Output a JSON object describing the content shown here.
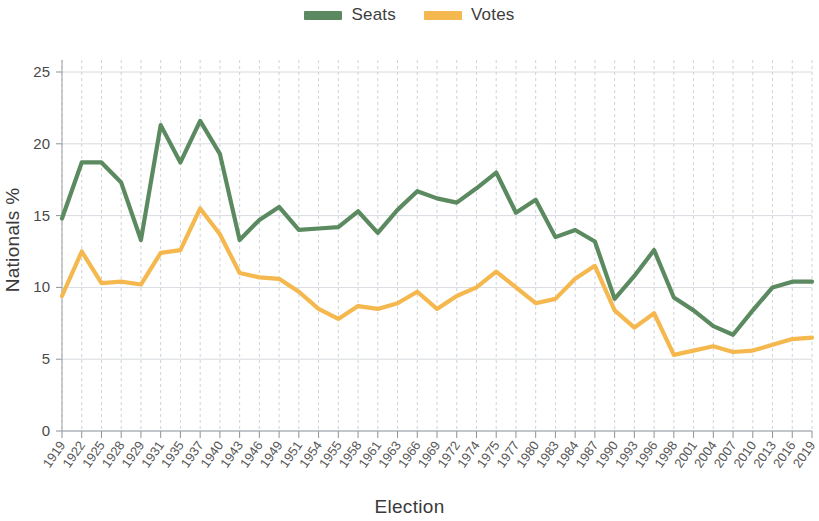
{
  "chart_data": {
    "type": "line",
    "title": "",
    "xlabel": "Election",
    "ylabel": "Nationals %",
    "ylim": [
      0,
      25
    ],
    "yticks": [
      0,
      5,
      10,
      15,
      20,
      25
    ],
    "grid": true,
    "legend_position": "top-center",
    "categories": [
      "1919",
      "1922",
      "1925",
      "1928",
      "1929",
      "1931",
      "1935",
      "1937",
      "1940",
      "1943",
      "1946",
      "1949",
      "1951",
      "1954",
      "1955",
      "1958",
      "1961",
      "1963",
      "1966",
      "1969",
      "1972",
      "1974",
      "1975",
      "1977",
      "1980",
      "1983",
      "1984",
      "1987",
      "1990",
      "1993",
      "1996",
      "1998",
      "2001",
      "2004",
      "2007",
      "2010",
      "2013",
      "2016",
      "2019"
    ],
    "series": [
      {
        "name": "Seats",
        "color": "#5b8a60",
        "values": [
          14.8,
          18.7,
          18.7,
          17.3,
          13.3,
          21.3,
          18.7,
          21.6,
          19.3,
          13.3,
          14.7,
          15.6,
          14.0,
          14.1,
          14.2,
          15.3,
          13.8,
          15.4,
          16.7,
          16.2,
          15.9,
          16.9,
          18.0,
          15.2,
          16.1,
          13.5,
          14.0,
          13.2,
          9.2,
          10.8,
          12.6,
          9.3,
          8.4,
          7.3,
          6.7,
          8.4,
          10.0,
          10.4,
          10.4
        ]
      },
      {
        "name": "Votes",
        "color": "#f5b84e",
        "values": [
          9.4,
          12.5,
          10.3,
          10.4,
          10.2,
          12.4,
          12.6,
          15.5,
          13.7,
          11.0,
          10.7,
          10.6,
          9.7,
          8.5,
          7.8,
          8.7,
          8.5,
          8.9,
          9.7,
          8.5,
          9.4,
          10.0,
          11.1,
          10.0,
          8.9,
          9.2,
          10.6,
          11.5,
          8.4,
          7.2,
          8.2,
          5.3,
          5.6,
          5.9,
          5.5,
          5.6,
          6.0,
          6.4,
          6.5
        ]
      }
    ]
  },
  "legend": {
    "entries": [
      {
        "label": "Seats",
        "color": "#5b8a60"
      },
      {
        "label": "Votes",
        "color": "#f5b84e"
      }
    ]
  },
  "axes": {
    "y_title": "Nationals %",
    "x_title": "Election"
  }
}
